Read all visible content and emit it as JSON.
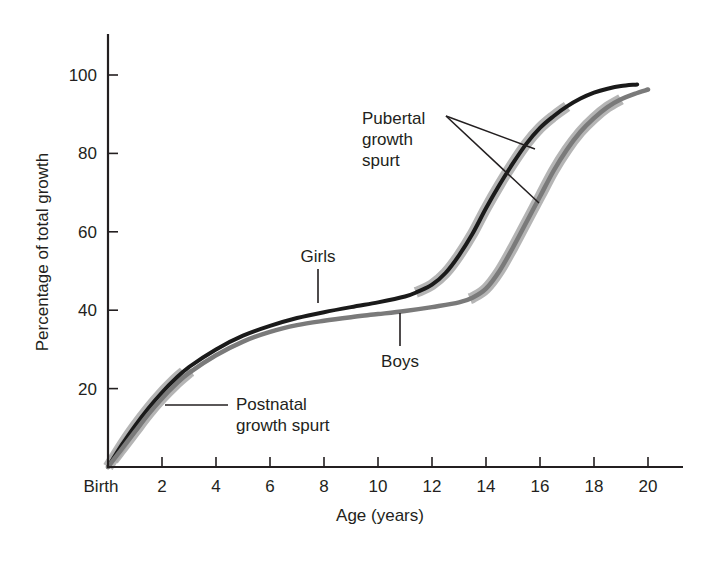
{
  "chart_data": {
    "type": "line",
    "title": "",
    "xlabel": "Age (years)",
    "ylabel": "Percentage of total growth",
    "xlim": [
      0,
      21.3
    ],
    "ylim": [
      0,
      110
    ],
    "grid": false,
    "legend": "none (curves labeled directly)",
    "x_ticks": [
      {
        "value": 0,
        "label": "Birth"
      },
      {
        "value": 2,
        "label": "2"
      },
      {
        "value": 4,
        "label": "4"
      },
      {
        "value": 6,
        "label": "6"
      },
      {
        "value": 8,
        "label": "8"
      },
      {
        "value": 10,
        "label": "10"
      },
      {
        "value": 12,
        "label": "12"
      },
      {
        "value": 14,
        "label": "14"
      },
      {
        "value": 16,
        "label": "16"
      },
      {
        "value": 18,
        "label": "18"
      },
      {
        "value": 20,
        "label": "20"
      }
    ],
    "y_ticks": [
      {
        "value": 20,
        "label": "20"
      },
      {
        "value": 40,
        "label": "40"
      },
      {
        "value": 60,
        "label": "60"
      },
      {
        "value": 80,
        "label": "80"
      },
      {
        "value": 100,
        "label": "100"
      }
    ],
    "series": [
      {
        "name": "Girls",
        "color": "#1a1a1a",
        "x": [
          0,
          0.5,
          1,
          1.5,
          2,
          2.5,
          3,
          4,
          5,
          6,
          7,
          8,
          9,
          10,
          11,
          11.5,
          12,
          12.5,
          13,
          13.5,
          14,
          14.5,
          15,
          15.5,
          16,
          16.5,
          17,
          17.5,
          18,
          18.5,
          19,
          19.6
        ],
        "values": [
          0,
          5.5,
          10.5,
          15,
          19,
          22.5,
          25.5,
          30,
          33.5,
          36,
          38,
          39.5,
          40.8,
          42,
          43.5,
          44.8,
          46.5,
          49.5,
          54,
          59.5,
          66,
          72,
          77.5,
          82.5,
          86.5,
          89.5,
          92,
          94,
          95.5,
          96.5,
          97.2,
          97.6
        ]
      },
      {
        "name": "Boys",
        "color": "#7a7a7a",
        "x": [
          0,
          0.5,
          1,
          1.5,
          2,
          2.5,
          3,
          4,
          5,
          6,
          7,
          8,
          9,
          10,
          11,
          12,
          13,
          13.5,
          14,
          14.5,
          15,
          15.5,
          16,
          16.5,
          17,
          17.5,
          18,
          18.5,
          19,
          19.5,
          20
        ],
        "values": [
          0,
          4.5,
          9,
          13.5,
          17.5,
          21,
          24,
          28.5,
          32,
          34.5,
          36.2,
          37.3,
          38.2,
          39,
          39.8,
          40.8,
          42,
          43.2,
          45.5,
          50,
          56,
          62.5,
          69,
          75.5,
          81,
          85.5,
          89,
          91.8,
          93.8,
          95.2,
          96.3
        ]
      }
    ],
    "highlights": [
      {
        "series": "Girls",
        "label": "Postnatal growth spurt",
        "from": 0,
        "to": 2.8,
        "color": "#a8a8a8"
      },
      {
        "series": "Boys",
        "label": "Postnatal growth spurt",
        "from": 0.2,
        "to": 3.1,
        "color": "#a8a8a8"
      },
      {
        "series": "Girls",
        "label": "Pubertal growth spurt",
        "from": 11.4,
        "to": 17.0,
        "color": "#a8a8a8"
      },
      {
        "series": "Boys",
        "label": "Pubertal growth spurt",
        "from": 13.4,
        "to": 19.0,
        "color": "#a8a8a8"
      }
    ],
    "annotations": [
      {
        "text": "Girls",
        "x": 7.5,
        "y": 54
      },
      {
        "text": "Boys",
        "x": 10.1,
        "y": 27
      },
      {
        "text": [
          "Pubertal",
          "growth",
          "spurt"
        ],
        "x": 13.9,
        "y": 97
      },
      {
        "text": [
          "Postnatal",
          "growth spurt"
        ],
        "x": 3.8,
        "y": 16
      }
    ]
  },
  "labels": {
    "x_axis_title": "Age (years)",
    "y_axis_title": "Percentage of total growth",
    "girls": "Girls",
    "boys": "Boys",
    "pubertal_line1": "Pubertal",
    "pubertal_line2": "growth",
    "pubertal_line3": "spurt",
    "postnatal_line1": "Postnatal",
    "postnatal_line2": "growth spurt"
  }
}
